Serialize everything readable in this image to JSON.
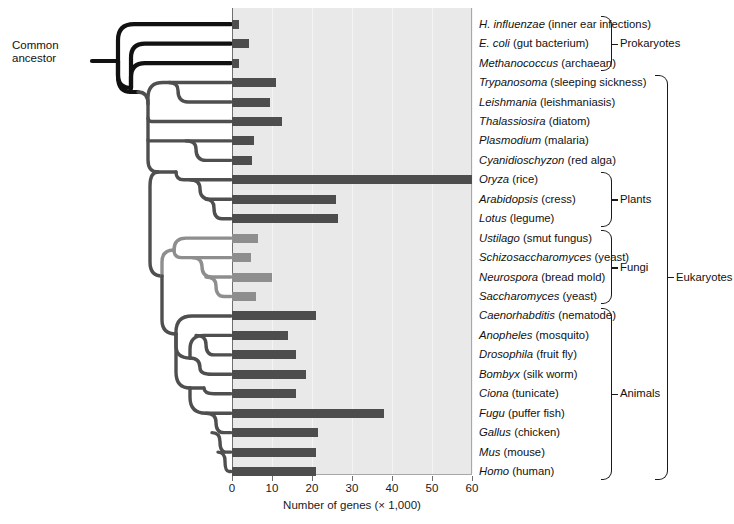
{
  "chart_data": {
    "type": "bar",
    "title": "",
    "xlabel": "Number of genes (× 1,000)",
    "ylabel": "",
    "xlim": [
      0,
      60
    ],
    "xticks": [
      0,
      10,
      20,
      30,
      40,
      50,
      60
    ],
    "grid": true,
    "orientation": "horizontal",
    "categories": [
      "H. influenzae",
      "E. coli",
      "Methanococcus",
      "Trypanosoma",
      "Leishmania",
      "Thalassiosira",
      "Plasmodium",
      "Cyanidioschyzon",
      "Oryza",
      "Arabidopsis",
      "Lotus",
      "Ustilago",
      "Schizosaccharomyces",
      "Neurospora",
      "Saccharomyces",
      "Caenorhabditis",
      "Anopheles",
      "Drosophila",
      "Bombyx",
      "Ciona",
      "Fugu",
      "Gallus",
      "Mus",
      "Homo"
    ],
    "values": [
      1.7,
      4.3,
      1.7,
      11,
      9.5,
      12.5,
      5.5,
      5,
      60,
      26,
      26.5,
      6.5,
      4.8,
      10,
      6,
      21,
      14,
      16,
      18.5,
      16,
      38,
      21.5,
      21,
      21
    ],
    "note": "Bar for Oryza extends to the right edge of the plot (axis maximum)."
  },
  "axis": {
    "title": "Number of genes (× 1,000)",
    "ticks": [
      "0",
      "10",
      "20",
      "30",
      "40",
      "50",
      "60"
    ]
  },
  "tree": {
    "root_label_line1": "Common",
    "root_label_line2": "ancestor"
  },
  "taxa": [
    {
      "genus": "H. influenzae",
      "common": " (inner ear infections)",
      "value": 1.7,
      "shade": "dark"
    },
    {
      "genus": "E. coli",
      "common": " (gut bacterium)",
      "value": 4.3,
      "shade": "dark"
    },
    {
      "genus": "Methanococcus",
      "common": " (archaean)",
      "value": 1.7,
      "shade": "dark"
    },
    {
      "genus": "Trypanosoma",
      "common": " (sleeping sickness)",
      "value": 11,
      "shade": "dark"
    },
    {
      "genus": "Leishmania",
      "common": " (leishmaniasis)",
      "value": 9.5,
      "shade": "dark"
    },
    {
      "genus": "Thalassiosira",
      "common": " (diatom)",
      "value": 12.5,
      "shade": "dark"
    },
    {
      "genus": "Plasmodium",
      "common": " (malaria)",
      "value": 5.5,
      "shade": "dark"
    },
    {
      "genus": "Cyanidioschyzon",
      "common": " (red alga)",
      "value": 5,
      "shade": "dark"
    },
    {
      "genus": "Oryza",
      "common": " (rice)",
      "value": 60,
      "shade": "dark"
    },
    {
      "genus": "Arabidopsis",
      "common": " (cress)",
      "value": 26,
      "shade": "dark"
    },
    {
      "genus": "Lotus",
      "common": " (legume)",
      "value": 26.5,
      "shade": "dark"
    },
    {
      "genus": "Ustilago",
      "common": " (smut fungus)",
      "value": 6.5,
      "shade": "light"
    },
    {
      "genus": "Schizosaccharomyces",
      "common": " (yeast)",
      "value": 4.8,
      "shade": "light"
    },
    {
      "genus": "Neurospora",
      "common": " (bread mold)",
      "value": 10,
      "shade": "light"
    },
    {
      "genus": "Saccharomyces",
      "common": " (yeast)",
      "value": 6,
      "shade": "light"
    },
    {
      "genus": "Caenorhabditis",
      "common": " (nematode)",
      "value": 21,
      "shade": "dark"
    },
    {
      "genus": "Anopheles",
      "common": " (mosquito)",
      "value": 14,
      "shade": "dark"
    },
    {
      "genus": "Drosophila",
      "common": " (fruit fly)",
      "value": 16,
      "shade": "dark"
    },
    {
      "genus": "Bombyx",
      "common": " (silk worm)",
      "value": 18.5,
      "shade": "dark"
    },
    {
      "genus": "Ciona",
      "common": " (tunicate)",
      "value": 16,
      "shade": "dark"
    },
    {
      "genus": "Fugu",
      "common": " (puffer fish)",
      "value": 38,
      "shade": "dark"
    },
    {
      "genus": "Gallus",
      "common": " (chicken)",
      "value": 21.5,
      "shade": "dark"
    },
    {
      "genus": "Mus",
      "common": " (mouse)",
      "value": 21,
      "shade": "dark"
    },
    {
      "genus": "Homo",
      "common": " (human)",
      "value": 21,
      "shade": "dark"
    }
  ],
  "groups": [
    {
      "label": "Prokaryotes",
      "first": 0,
      "last": 2,
      "level": 1
    },
    {
      "label": "Plants",
      "first": 8,
      "last": 10,
      "level": 1
    },
    {
      "label": "Fungi",
      "first": 11,
      "last": 14,
      "level": 1
    },
    {
      "label": "Animals",
      "first": 15,
      "last": 23,
      "level": 1
    },
    {
      "label": "Eukaryotes",
      "first": 3,
      "last": 23,
      "level": 2
    }
  ],
  "colors": {
    "bar_dark": "#4d4d4d",
    "bar_light": "#8e8e8e",
    "plot_background": "#e9e9e9",
    "gridline": "#f4f4f4",
    "axis": "#6f6f6f",
    "text": "#111111",
    "tree_dark": "#111111",
    "tree_mid": "#4f4f4f",
    "tree_light": "#8e8e8e"
  }
}
